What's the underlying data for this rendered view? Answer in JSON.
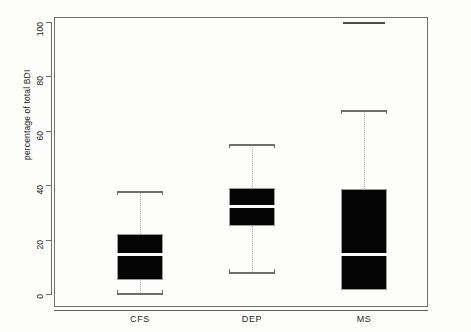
{
  "chart_data": {
    "type": "box",
    "title": "",
    "subtitle": "",
    "xlabel": "",
    "ylabel": "percentage of total BDI",
    "categories": [
      "CFS",
      "DEP",
      "MS"
    ],
    "ylim": [
      0,
      105
    ],
    "yticks": [
      0,
      20,
      40,
      60,
      80,
      100
    ],
    "ytick_labels": [
      "0",
      "20",
      "40",
      "60",
      "80",
      "100"
    ],
    "grid": false,
    "legend": null,
    "box_fill_color": "#050505",
    "median_color": "#fbfbfb",
    "whisker_color": "#b4b4b4",
    "axis_color": "#6f6f6f",
    "boxes": [
      {
        "label": "CFS",
        "whisker_low": 0.5,
        "q1": 5.0,
        "median": 14.5,
        "q3": 22.0,
        "whisker_high": 38.0,
        "outliers": []
      },
      {
        "label": "DEP",
        "whisker_low": 8.0,
        "q1": 25.0,
        "median": 32.0,
        "q3": 39.0,
        "whisker_high": 55.0,
        "outliers": []
      },
      {
        "label": "MS",
        "whisker_low": 1.5,
        "q1": 1.5,
        "median": 14.5,
        "q3": 38.5,
        "whisker_high": 67.5,
        "outliers": [
          100.0
        ]
      }
    ]
  },
  "axis": {
    "y_title": "percentage of total BDI",
    "tick_0": "0",
    "tick_20": "20",
    "tick_40": "40",
    "tick_60": "60",
    "tick_80": "80",
    "tick_100": "100",
    "x_label_cfs": "CFS",
    "x_label_dep": "DEP",
    "x_label_ms": "MS"
  }
}
